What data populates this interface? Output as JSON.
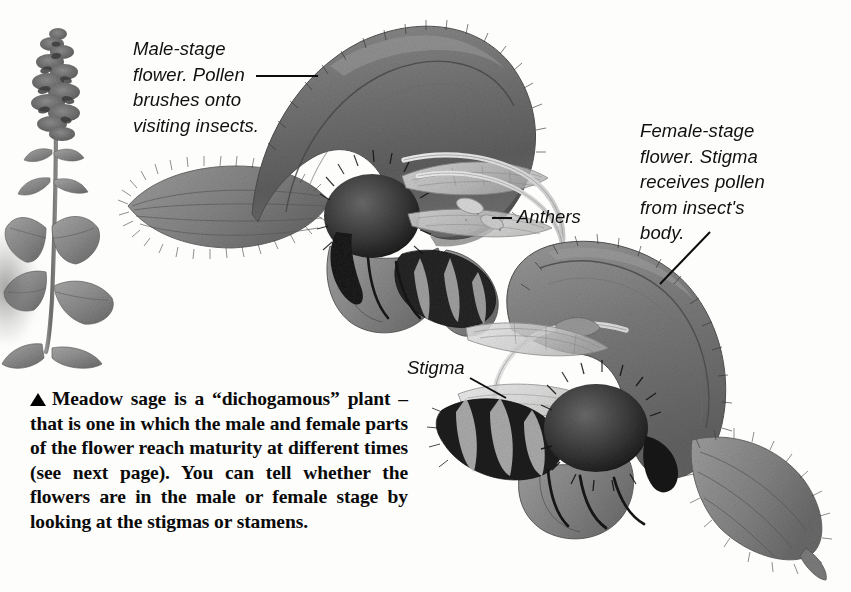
{
  "page": {
    "background_color": "#fdfdfb",
    "ink_color": "#0a0a0a",
    "illustration_gray": "#808080"
  },
  "captions": {
    "male_stage": "Male-stage\nflower. Pollen\nbrushes onto\nvisiting insects.",
    "female_stage": "Female-stage\nflower. Stigma\nreceives pollen\nfrom insect's\nbody."
  },
  "labels": {
    "anthers": "Anthers",
    "stigma": "Stigma"
  },
  "body": {
    "line1": "Meadow sage is a “dichogamous”",
    "line2": "plant – that is one in which the male",
    "line3": "and female parts of the flower reach",
    "line4": "maturity at different times (see next",
    "line5": "page). You can tell whether the",
    "line6": "flowers are in the male or female stage",
    "line7": "by looking at the stigmas or stamens."
  },
  "illustration": {
    "plant_label": "meadow-sage-plant",
    "male_flower_label": "male-stage-flower-with-bee",
    "female_flower_label": "female-stage-flower-with-bee"
  }
}
